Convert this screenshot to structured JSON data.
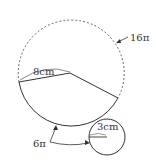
{
  "diagram": {
    "type": "cone-net",
    "labels": {
      "arc_large_circle": "16π",
      "slant_height": "8cm",
      "arc_length": "6π",
      "base_radius": "3cm"
    },
    "colors": {
      "stroke": "#333333",
      "dashed": "#555555",
      "background": "#ffffff"
    }
  }
}
